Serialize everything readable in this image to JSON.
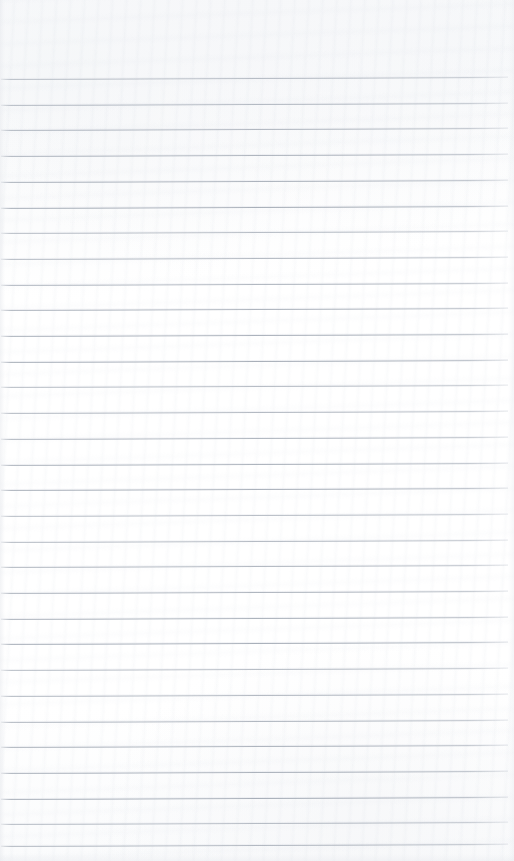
{
  "document": {
    "kind": "scanned-ruled-paper",
    "title": "Blank ruled notebook page",
    "content_text": "",
    "handwriting": "",
    "printed_text": "",
    "page_number": "",
    "header": "",
    "footer": "",
    "margin_rule": "none",
    "holes": "none"
  },
  "canvas": {
    "width": 514,
    "height": 861,
    "paper_color": "#fdfdfe",
    "paper_shade_color": "#f5f6f8",
    "edge_shadow_color": "#e8eaee"
  },
  "ruling": {
    "style": "horizontal-lined",
    "line_color": "#a4abb5",
    "line_width_px": 1,
    "line_count": 31,
    "first_line_y": 79,
    "spacing_px": 25.7,
    "left_inset_px": 1,
    "right_inset_px": 6,
    "tilt_deg": -0.22,
    "top_margin_px": 79,
    "bottom_margin_px": 15,
    "lines_y": [
      79.0,
      104.7,
      130.4,
      156.1,
      181.8,
      207.5,
      233.2,
      258.9,
      284.6,
      310.3,
      336.0,
      361.7,
      387.4,
      413.1,
      438.8,
      464.5,
      490.2,
      515.9,
      541.6,
      567.3,
      593.0,
      618.7,
      644.4,
      670.1,
      695.8,
      721.5,
      747.2,
      772.9,
      798.6,
      824.3,
      846.0
    ]
  }
}
